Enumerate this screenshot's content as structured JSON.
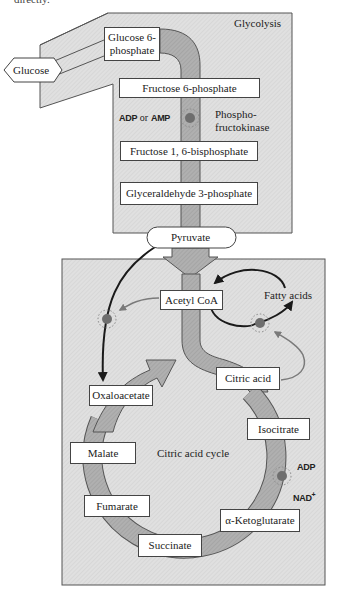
{
  "caption_fragment": "directly.",
  "glycolysis": {
    "title": "Glycolysis",
    "start": "Glucose",
    "steps": [
      "Glucose 6-phosphate",
      "Fructose 6-phosphate",
      "Fructose 1, 6-bisphosphate",
      "Glyceraldehyde 3-phosphate"
    ],
    "glucose6p_line1": "Glucose 6-",
    "glucose6p_line2": "phosphate",
    "enzyme_line1": "Phospho-",
    "enzyme_line2": "fructokinase",
    "regulator_adp": "ADP",
    "regulator_or": "or",
    "regulator_amp": "AMP",
    "end": "Pyruvate"
  },
  "citric_acid_cycle": {
    "title": "Citric acid cycle",
    "entry": "Acetyl CoA",
    "fatty_acids": "Fatty acids",
    "intermediates": [
      "Citric acid",
      "Isocitrate",
      "α-Ketoglutarate",
      "Succinate",
      "Fumarate",
      "Malate",
      "Oxaloacetate"
    ],
    "regulators": [
      "ADP",
      "NAD+"
    ],
    "nad_label": "NAD",
    "nad_sup": "+"
  },
  "colors": {
    "panel_fill": "#dcdcdc",
    "pathway_band": "#a9a9a9",
    "regulation_dot": "#6e6e6e",
    "arrow_dark": "#1a1a1a",
    "arrow_gray": "#7a7a7a"
  }
}
